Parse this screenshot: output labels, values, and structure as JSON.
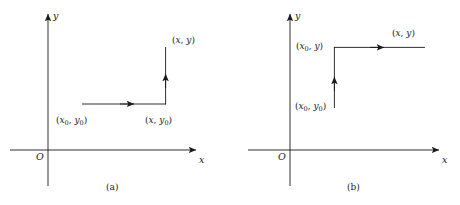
{
  "figure": {
    "type": "math-diagram",
    "stroke_color": "#1a1a1a",
    "background_color": "#ffffff"
  },
  "panels": [
    {
      "id": "a",
      "caption": "(a)",
      "axes": {
        "x_label": "x",
        "y_label": "y",
        "origin_label": "O"
      },
      "path_order": "horizontal-then-vertical",
      "points": [
        {
          "name": "start",
          "label_x": "x",
          "label_x_sub": "0",
          "label_y": "y",
          "label_y_sub": "0",
          "text": "(x0, y0)"
        },
        {
          "name": "corner",
          "label_x": "x",
          "label_x_sub": "",
          "label_y": "y",
          "label_y_sub": "0",
          "text": "(x, y0)"
        },
        {
          "name": "end",
          "label_x": "x",
          "label_x_sub": "",
          "label_y": "y",
          "label_y_sub": "",
          "text": "(x, y)"
        }
      ]
    },
    {
      "id": "b",
      "caption": "(b)",
      "axes": {
        "x_label": "x",
        "y_label": "y",
        "origin_label": "O"
      },
      "path_order": "vertical-then-horizontal",
      "points": [
        {
          "name": "start",
          "label_x": "x",
          "label_x_sub": "0",
          "label_y": "y",
          "label_y_sub": "0",
          "text": "(x0, y0)"
        },
        {
          "name": "corner",
          "label_x": "x",
          "label_x_sub": "0",
          "label_y": "y",
          "label_y_sub": "",
          "text": "(x0, y)"
        },
        {
          "name": "end",
          "label_x": "x",
          "label_x_sub": "",
          "label_y": "y",
          "label_y_sub": "",
          "text": "(x, y)"
        }
      ]
    }
  ]
}
